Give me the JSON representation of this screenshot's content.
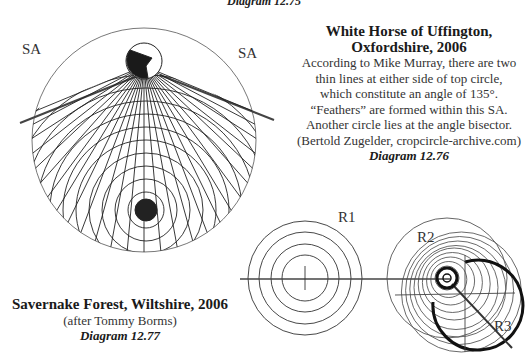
{
  "header": {
    "diagram_label": "Diagram 12.75"
  },
  "diagram_76": {
    "title_line1": "White Horse of Uffington,",
    "title_line2": "Oxfordshire, 2006",
    "body_lines": [
      "According to Mike Murray, there are two",
      "thin lines at either side of top circle,",
      "which constitute an angle of 135°.",
      "“Feathers” are formed within this SA.",
      "Another circle lies at the angle bisector.",
      "(Bertold Zugelder, cropcircle-archive.com)"
    ],
    "diagram_label": "Diagram 12.76",
    "labels": {
      "sa_left": "SA",
      "sa_right": "SA"
    },
    "angle_degrees": 135
  },
  "diagram_77": {
    "title": "Savernake Forest, Wiltshire, 2006",
    "credit": "(after Tommy Borms)",
    "diagram_label": "Diagram 12.77",
    "labels": {
      "r1": "R1",
      "r2": "R2",
      "r3": "R3"
    }
  }
}
